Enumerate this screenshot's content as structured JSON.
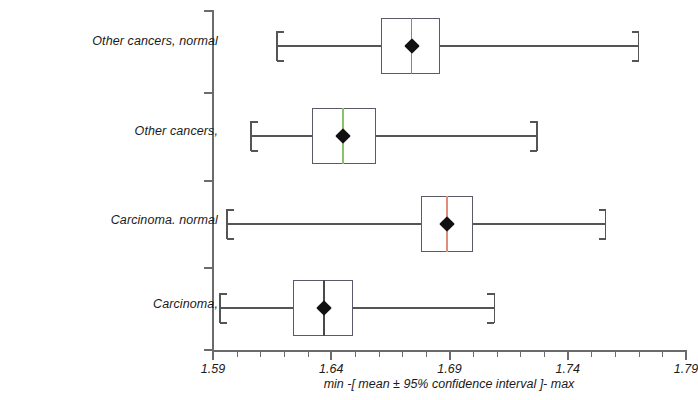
{
  "chart_data": {
    "type": "box",
    "title": "",
    "xlabel": "min -[ mean ± 95% confidence interval ]- max",
    "ylabel": "",
    "xlim": [
      1.59,
      1.79
    ],
    "xticks": [
      "1.59",
      "1.64",
      "1.69",
      "1.74",
      "1.79"
    ],
    "xtick_values": [
      1.59,
      1.64,
      1.69,
      1.74,
      1.79
    ],
    "minor_ticks_per_interval": 4,
    "grid": false,
    "legend": "none",
    "categories": [
      "Other cancers, normal",
      "Other cancers,",
      "Carcinoma. normal",
      "Carcinoma,"
    ],
    "series": [
      {
        "name": "Other cancers, normal",
        "min": 1.617,
        "ci_low": 1.661,
        "mean": 1.674,
        "ci_high": 1.686,
        "max": 1.77,
        "median_color": "#7b7fc4"
      },
      {
        "name": "Other cancers,",
        "min": 1.606,
        "ci_low": 1.632,
        "mean": 1.645,
        "ci_high": 1.659,
        "max": 1.727,
        "median_color": "#86c46a"
      },
      {
        "name": "Carcinoma. normal",
        "min": 1.596,
        "ci_low": 1.678,
        "mean": 1.689,
        "ci_high": 1.7,
        "max": 1.756,
        "median_color": "#e08d7a"
      },
      {
        "name": "Carcinoma,",
        "min": 1.593,
        "ci_low": 1.624,
        "mean": 1.637,
        "ci_high": 1.649,
        "max": 1.709,
        "median_color": "#4a4a4a"
      }
    ],
    "colors": {
      "axis": "#6b6b6b",
      "box_edge": "#5a5a6a",
      "whisker": "#555555",
      "mean_marker": "#111111",
      "text": "#1a1a1a",
      "background": "#ffffff"
    }
  }
}
